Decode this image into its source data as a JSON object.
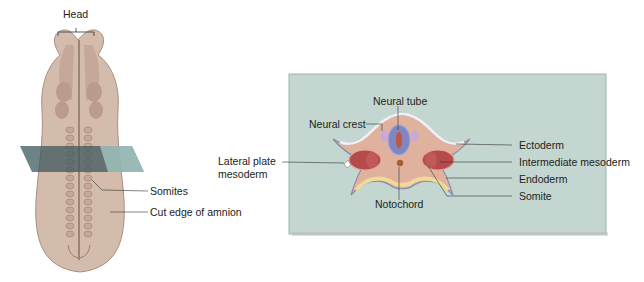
{
  "embryo": {
    "labels": {
      "head": "Head",
      "somites": "Somites",
      "cut_edge": "Cut edge of amnion"
    }
  },
  "cross_section": {
    "labels": {
      "neural_tube": "Neural tube",
      "neural_crest": "Neural crest",
      "lateral_plate_1": "Lateral plate",
      "lateral_plate_2": "mesoderm",
      "notochord": "Notochord",
      "ectoderm": "Ectoderm",
      "intermediate_mesoderm": "Intermediate mesoderm",
      "endoderm": "Endoderm",
      "somite": "Somite"
    }
  },
  "colors": {
    "embryo_body": "#cdb3a3",
    "panel_bg": "#c3d6cf",
    "ectoderm": "#8f8fb8",
    "mesoderm": "#e3b49e",
    "somite": "#b24a4a",
    "endoderm": "#f0dc9a",
    "neural_tube": "#7f84c0"
  }
}
